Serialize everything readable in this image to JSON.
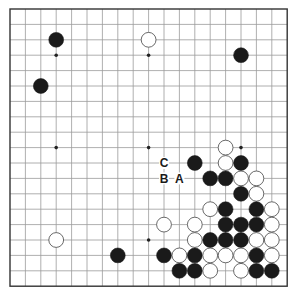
{
  "diagram": {
    "type": "go-board",
    "size": 19,
    "origin": {
      "x": 10,
      "y": 9
    },
    "spacing": 15.4,
    "stone_radius": 7.4,
    "colors": {
      "black": "#1a1a1a",
      "white": "#ffffff",
      "grid": "#9a9a9a",
      "edge": "#333333"
    },
    "star_points": [
      [
        3,
        3
      ],
      [
        9,
        3
      ],
      [
        15,
        3
      ],
      [
        3,
        9
      ],
      [
        9,
        9
      ],
      [
        15,
        9
      ],
      [
        3,
        15
      ],
      [
        9,
        15
      ],
      [
        15,
        15
      ]
    ],
    "stones": [
      {
        "color": "black",
        "col": 3,
        "row": 2
      },
      {
        "color": "white",
        "col": 9,
        "row": 2
      },
      {
        "color": "black",
        "col": 15,
        "row": 3
      },
      {
        "color": "black",
        "col": 2,
        "row": 5
      },
      {
        "color": "white",
        "col": 14,
        "row": 9
      },
      {
        "color": "black",
        "col": 12,
        "row": 10
      },
      {
        "color": "white",
        "col": 14,
        "row": 10
      },
      {
        "color": "black",
        "col": 15,
        "row": 10
      },
      {
        "color": "black",
        "col": 13,
        "row": 11
      },
      {
        "color": "black",
        "col": 14,
        "row": 11
      },
      {
        "color": "white",
        "col": 15,
        "row": 11
      },
      {
        "color": "white",
        "col": 16,
        "row": 11
      },
      {
        "color": "black",
        "col": 15,
        "row": 12
      },
      {
        "color": "white",
        "col": 16,
        "row": 12
      },
      {
        "color": "white",
        "col": 13,
        "row": 13
      },
      {
        "color": "black",
        "col": 14,
        "row": 13
      },
      {
        "color": "black",
        "col": 16,
        "row": 13
      },
      {
        "color": "white",
        "col": 17,
        "row": 13
      },
      {
        "color": "white",
        "col": 10,
        "row": 14
      },
      {
        "color": "white",
        "col": 12,
        "row": 14
      },
      {
        "color": "black",
        "col": 14,
        "row": 14
      },
      {
        "color": "black",
        "col": 15,
        "row": 14
      },
      {
        "color": "black",
        "col": 16,
        "row": 14
      },
      {
        "color": "white",
        "col": 17,
        "row": 14
      },
      {
        "color": "white",
        "col": 3,
        "row": 15
      },
      {
        "color": "white",
        "col": 12,
        "row": 15
      },
      {
        "color": "black",
        "col": 13,
        "row": 15
      },
      {
        "color": "black",
        "col": 14,
        "row": 15
      },
      {
        "color": "black",
        "col": 15,
        "row": 15
      },
      {
        "color": "white",
        "col": 16,
        "row": 15
      },
      {
        "color": "white",
        "col": 17,
        "row": 15
      },
      {
        "color": "black",
        "col": 7,
        "row": 16
      },
      {
        "color": "black",
        "col": 10,
        "row": 16
      },
      {
        "color": "white",
        "col": 11,
        "row": 16
      },
      {
        "color": "black",
        "col": 12,
        "row": 16
      },
      {
        "color": "white",
        "col": 13,
        "row": 16
      },
      {
        "color": "white",
        "col": 14,
        "row": 16
      },
      {
        "color": "white",
        "col": 15,
        "row": 16
      },
      {
        "color": "black",
        "col": 16,
        "row": 16
      },
      {
        "color": "white",
        "col": 17,
        "row": 16
      },
      {
        "color": "black",
        "col": 11,
        "row": 17
      },
      {
        "color": "black",
        "col": 12,
        "row": 17
      },
      {
        "color": "white",
        "col": 13,
        "row": 17
      },
      {
        "color": "white",
        "col": 15,
        "row": 17
      },
      {
        "color": "black",
        "col": 16,
        "row": 17
      },
      {
        "color": "black",
        "col": 17,
        "row": 17
      }
    ],
    "labels": [
      {
        "text": "C",
        "col": 10,
        "row": 10
      },
      {
        "text": "B",
        "col": 10,
        "row": 11
      },
      {
        "text": "A",
        "col": 11,
        "row": 11
      }
    ]
  }
}
